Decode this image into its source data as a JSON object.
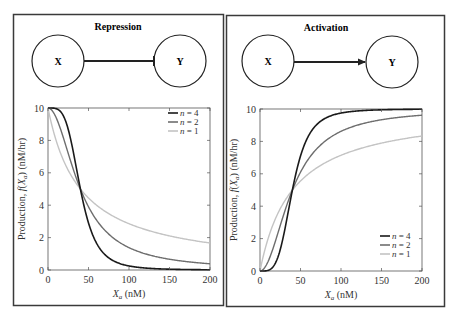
{
  "panels": [
    {
      "title": "Repression",
      "node_x": "X",
      "node_y": "Y",
      "edge_type": "repression",
      "ylabel": "Production, f(X_a) (nM/hr)",
      "xlabel": "X_a (nM)"
    },
    {
      "title": "Activation",
      "node_x": "X",
      "node_y": "Y",
      "edge_type": "activation",
      "ylabel": "Production, f(X_a) (nM/hr)",
      "xlabel": "X_a (nM)"
    }
  ],
  "colors": {
    "n4": "#1a1a1a",
    "n2": "#6e6e6e",
    "n1": "#c4c4c4",
    "border": "#3a3a3a"
  },
  "chart_data": [
    {
      "type": "line",
      "title": "Repression",
      "xlabel": "X_a (nM)",
      "ylabel": "Production, f(X_a) (nM/hr)",
      "xlim": [
        0,
        200
      ],
      "ylim": [
        0,
        10
      ],
      "xticks": [
        0,
        50,
        100,
        150,
        200
      ],
      "yticks": [
        0,
        2,
        4,
        6,
        8,
        10
      ],
      "function": "repression",
      "beta": 10,
      "K": 40,
      "legend_position": "upper right",
      "series": [
        {
          "name": "n = 4",
          "n": 4,
          "color": "#1a1a1a",
          "x": [
            0,
            25,
            40,
            50,
            75,
            100,
            150,
            200
          ],
          "y": [
            10,
            8.68,
            5.0,
            2.91,
            0.78,
            0.25,
            0.05,
            0.02
          ]
        },
        {
          "name": "n = 2",
          "n": 2,
          "color": "#6e6e6e",
          "x": [
            0,
            25,
            40,
            50,
            75,
            100,
            150,
            200
          ],
          "y": [
            10,
            7.19,
            5.0,
            3.9,
            2.21,
            1.38,
            0.66,
            0.38
          ]
        },
        {
          "name": "n = 1",
          "n": 1,
          "color": "#c4c4c4",
          "x": [
            0,
            25,
            40,
            50,
            75,
            100,
            150,
            200
          ],
          "y": [
            10,
            6.15,
            5.0,
            4.44,
            3.48,
            2.86,
            2.11,
            1.67
          ]
        }
      ]
    },
    {
      "type": "line",
      "title": "Activation",
      "xlabel": "X_a (nM)",
      "ylabel": "Production, f(X_a) (nM/hr)",
      "xlim": [
        0,
        200
      ],
      "ylim": [
        0,
        10
      ],
      "xticks": [
        0,
        50,
        100,
        150,
        200
      ],
      "yticks": [
        0,
        2,
        4,
        6,
        8,
        10
      ],
      "function": "activation",
      "beta": 10,
      "K": 40,
      "legend_position": "lower right",
      "series": [
        {
          "name": "n = 4",
          "n": 4,
          "color": "#1a1a1a",
          "x": [
            0,
            25,
            40,
            50,
            75,
            100,
            150,
            200
          ],
          "y": [
            0,
            1.32,
            5.0,
            7.09,
            9.22,
            9.75,
            9.95,
            9.98
          ]
        },
        {
          "name": "n = 2",
          "n": 2,
          "color": "#6e6e6e",
          "x": [
            0,
            25,
            40,
            50,
            75,
            100,
            150,
            200
          ],
          "y": [
            0,
            2.81,
            5.0,
            6.1,
            7.79,
            8.62,
            9.34,
            9.62
          ]
        },
        {
          "name": "n = 1",
          "n": 1,
          "color": "#c4c4c4",
          "x": [
            0,
            25,
            40,
            50,
            75,
            100,
            150,
            200
          ],
          "y": [
            0,
            3.85,
            5.0,
            5.56,
            6.52,
            7.14,
            7.89,
            8.33
          ]
        }
      ]
    }
  ]
}
